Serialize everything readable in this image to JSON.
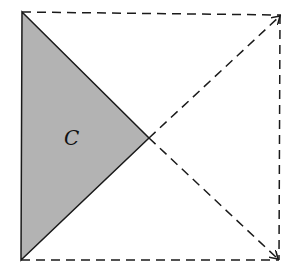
{
  "diagram": {
    "region_label": "C",
    "colors": {
      "fill": "#b3b3b3",
      "stroke": "#1a1a1a",
      "background": "#ffffff"
    },
    "points": {
      "top_left": [
        22,
        12
      ],
      "top_right": [
        281,
        15
      ],
      "bottom_left": [
        21,
        260
      ],
      "bottom_right": [
        279,
        260
      ],
      "center": [
        149,
        138
      ]
    }
  }
}
